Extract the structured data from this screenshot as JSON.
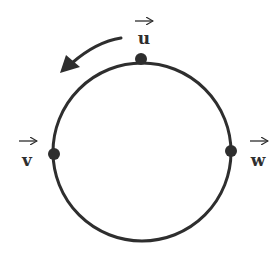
{
  "diagram": {
    "colors": {
      "stroke": "#2e2e2e",
      "background": "#ffffff"
    },
    "circle": {
      "cx": 142,
      "cy": 152,
      "r": 89
    },
    "points": [
      {
        "id": "u",
        "label": "u",
        "vector": true,
        "x": 141,
        "y": 59,
        "label_x": 141,
        "label_y": 44
      },
      {
        "id": "v",
        "label": "v",
        "vector": true,
        "x": 54,
        "y": 154,
        "label_x": 27,
        "label_y": 164
      },
      {
        "id": "w",
        "label": "w",
        "vector": true,
        "x": 231,
        "y": 151,
        "label_x": 258,
        "label_y": 164
      }
    ],
    "direction_arrow": {
      "direction": "counterclockwise"
    }
  }
}
